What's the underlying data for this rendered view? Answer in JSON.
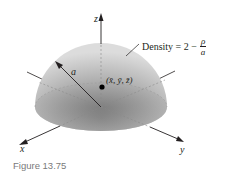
{
  "figure": {
    "caption": "Figure 13.75",
    "solid": "hemisphere",
    "axes": {
      "x_label": "x",
      "y_label": "y",
      "z_label": "z"
    },
    "radius_label": "a",
    "density_label": {
      "prefix": "Density = 2 −",
      "numerator": "ρ",
      "denominator": "a"
    },
    "centroid_label": "(x̄, ȳ, z̄)",
    "colors": {
      "surface_light": "#d9d9d9",
      "surface_dark": "#8c8c8c",
      "axis": "#231f20",
      "caption": "#7a7a7a"
    }
  }
}
